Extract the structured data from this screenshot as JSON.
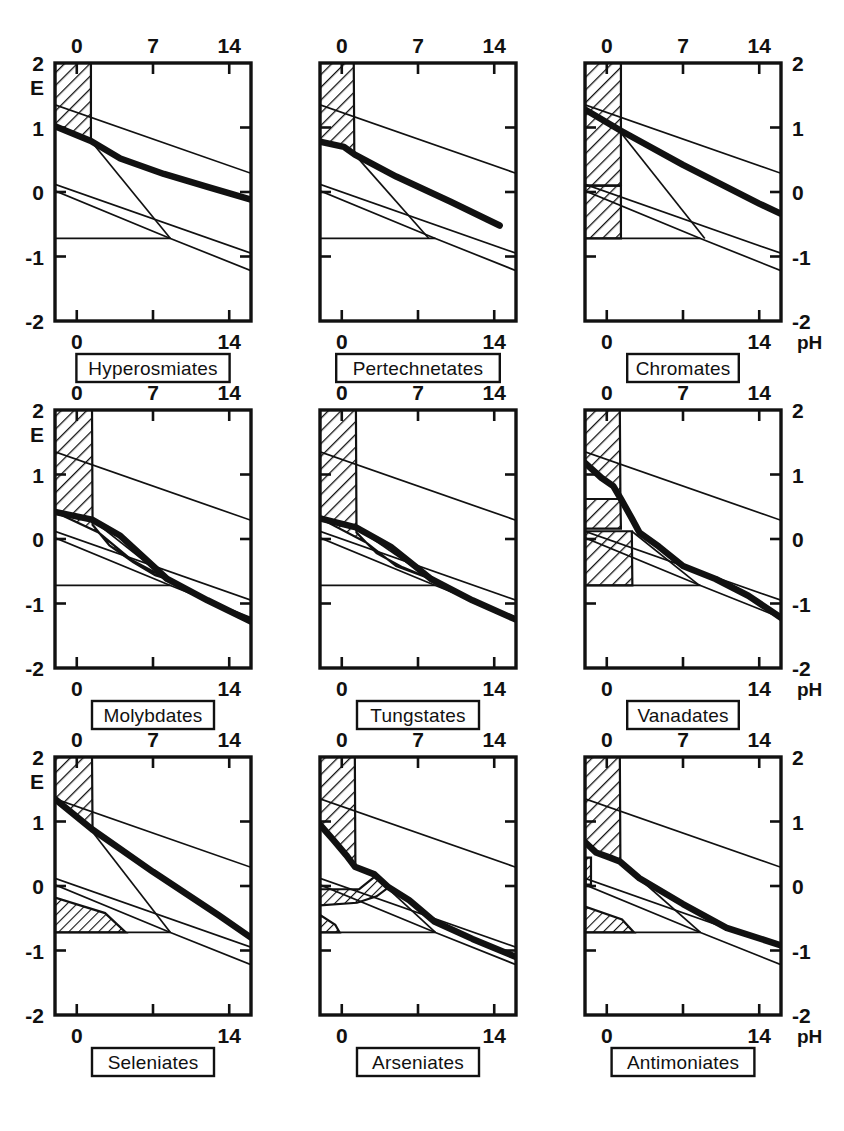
{
  "figure": {
    "type": "multi-panel-pourbaix",
    "rows": 3,
    "cols": 3,
    "axis_x_name": "pH",
    "axis_y_name": "E",
    "x_ticks": [
      "0",
      "7",
      "14"
    ],
    "x_tick_values": [
      0,
      7,
      14
    ],
    "y_ticks": [
      "2",
      "1",
      "0",
      "-1",
      "-2"
    ],
    "y_tick_values": [
      2,
      1,
      0,
      -1,
      -2
    ],
    "xlim": [
      -2,
      16
    ],
    "ylim": [
      -2,
      2
    ],
    "ink_color": "#111111",
    "paper_color": "#ffffff"
  },
  "chart_data": {
    "type": "line",
    "title": "",
    "subtitle": "",
    "xlabel": "pH",
    "ylabel": "E",
    "xlim": [
      -2,
      16
    ],
    "ylim": [
      -2,
      2
    ],
    "x_ticks": [
      0,
      7,
      14
    ],
    "y_ticks": [
      2,
      1,
      0,
      -1,
      -2
    ],
    "grid": false,
    "legend": "none",
    "panel_count": 9,
    "shared_series": [
      {
        "name": "oxygen-line",
        "note": "upper water stability limit, thin straight line",
        "points": [
          [
            -2,
            1.35
          ],
          [
            16,
            0.29
          ]
        ]
      },
      {
        "name": "hydrogen-line",
        "note": "lower water stability limit, thin straight line",
        "points": [
          [
            -2,
            0.12
          ],
          [
            16,
            -0.95
          ]
        ]
      },
      {
        "name": "neutral-baseline",
        "note": "thin horizontal line at E = -0.72 running from left axis to the crossing point",
        "points": [
          [
            -2,
            -0.72
          ],
          [
            8.6,
            -0.72
          ]
        ]
      },
      {
        "name": "lower-boundary-wedge",
        "note": "thin line descending from E = 0.02 at pH -2 to the junction near pH 8.6, then continuing to lower right",
        "points": [
          [
            -2,
            0.02
          ],
          [
            8.6,
            -0.72
          ],
          [
            16,
            -1.22
          ]
        ]
      }
    ],
    "panels": [
      {
        "index": 0,
        "row": 0,
        "col": 0,
        "label": "Hyperosmiates",
        "hatched_regions": [
          {
            "name": "acid-block",
            "note": "rectangle from pH -2 to 1.3, E 0.88 to 2.0"
          }
        ],
        "thick_curve": {
          "name": "stability-boundary",
          "points": [
            [
              -2,
              1.02
            ],
            [
              1.3,
              0.79
            ],
            [
              4.0,
              0.52
            ],
            [
              8.0,
              0.28
            ],
            [
              12.0,
              0.08
            ],
            [
              16.0,
              -0.12
            ]
          ]
        },
        "thin_wedge": {
          "points": [
            [
              1.3,
              0.79
            ],
            [
              8.6,
              -0.72
            ]
          ]
        }
      },
      {
        "index": 1,
        "row": 0,
        "col": 1,
        "label": "Pertechnetates",
        "hatched_regions": [
          {
            "name": "acid-block",
            "note": "rectangle from pH -2 to 1.1, E 0.62 to 2.0"
          }
        ],
        "thick_curve": {
          "name": "stability-boundary",
          "points": [
            [
              -2,
              0.78
            ],
            [
              0.2,
              0.7
            ],
            [
              1.2,
              0.58
            ],
            [
              5.0,
              0.24
            ],
            [
              10.0,
              -0.15
            ],
            [
              14.5,
              -0.52
            ]
          ]
        },
        "thin_wedge": {
          "points": [
            [
              1.2,
              0.58
            ],
            [
              8.0,
              -0.72
            ]
          ]
        }
      },
      {
        "index": 2,
        "row": 0,
        "col": 2,
        "label": "Chromates",
        "hatched_regions": [
          {
            "name": "acid-block-upper",
            "note": "rectangle pH -2 to 1.3, E 0.05 to 2.0"
          },
          {
            "name": "acid-block-lower",
            "note": "rectangle pH -2 to 1.3, E -0.72 to -0.28"
          }
        ],
        "thick_curve": {
          "name": "stability-boundary",
          "points": [
            [
              -2,
              1.28
            ],
            [
              1.3,
              0.95
            ],
            [
              7.0,
              0.42
            ],
            [
              14.0,
              -0.18
            ],
            [
              16.0,
              -0.34
            ]
          ]
        },
        "thin_wedge": {
          "points": [
            [
              1.3,
              0.92
            ],
            [
              9.0,
              -0.72
            ]
          ]
        }
      },
      {
        "index": 3,
        "row": 1,
        "col": 0,
        "label": "Molybdates",
        "hatched_regions": [
          {
            "name": "acid-block",
            "note": "rectangle pH -2 to 1.4, E 0.40 to 2.0"
          },
          {
            "name": "tapering-tail",
            "note": "narrow hatched wedge from pH 1.4 to 8.3 tapering to the junction"
          }
        ],
        "thick_curve": {
          "name": "stability-boundary",
          "points": [
            [
              -2,
              0.42
            ],
            [
              1.4,
              0.3
            ],
            [
              4.0,
              0.05
            ],
            [
              8.3,
              -0.62
            ],
            [
              12.0,
              -0.95
            ],
            [
              16.0,
              -1.28
            ]
          ]
        },
        "thin_wedge": {
          "points": [
            [
              1.4,
              0.3
            ],
            [
              8.3,
              -0.62
            ]
          ]
        }
      },
      {
        "index": 4,
        "row": 1,
        "col": 1,
        "label": "Tungstates",
        "hatched_regions": [
          {
            "name": "acid-block",
            "note": "rectangle pH -2 to 1.3, E 0.30 to 2.0"
          },
          {
            "name": "tapering-tail",
            "note": "narrow hatched wedge from pH 1.3 to 8.2"
          }
        ],
        "thick_curve": {
          "name": "stability-boundary",
          "points": [
            [
              -2,
              0.32
            ],
            [
              1.3,
              0.18
            ],
            [
              4.5,
              -0.12
            ],
            [
              8.2,
              -0.62
            ],
            [
              12.0,
              -0.95
            ],
            [
              16.0,
              -1.25
            ]
          ]
        },
        "thin_wedge": {
          "points": [
            [
              1.3,
              0.18
            ],
            [
              8.2,
              -0.62
            ]
          ]
        }
      },
      {
        "index": 5,
        "row": 1,
        "col": 2,
        "label": "Vanadates",
        "hatched_regions": [
          {
            "name": "acid-block-upper",
            "note": "rectangle pH -2 to 1.2, E 0.12 to 2.0"
          },
          {
            "name": "acid-block-lower",
            "note": "rectangle pH -2 to 2.3, E -0.72 to 0.12"
          }
        ],
        "thick_curve": {
          "name": "stability-boundary",
          "points": [
            [
              -2,
              1.18
            ],
            [
              -0.5,
              0.95
            ],
            [
              0.6,
              0.82
            ],
            [
              1.3,
              0.62
            ],
            [
              2.3,
              0.32
            ],
            [
              3.0,
              0.1
            ],
            [
              4.8,
              -0.12
            ],
            [
              7.0,
              -0.42
            ],
            [
              10.0,
              -0.62
            ],
            [
              13.0,
              -0.88
            ],
            [
              16.0,
              -1.22
            ]
          ]
        },
        "thin_wedge": {
          "points": [
            [
              2.3,
              0.12
            ],
            [
              8.5,
              -0.72
            ]
          ]
        }
      },
      {
        "index": 6,
        "row": 2,
        "col": 0,
        "label": "Seleniates",
        "hatched_regions": [
          {
            "name": "acid-block-upper",
            "note": "rectangle pH -2 to 1.4, E 0.62 to 2.0"
          },
          {
            "name": "lower-triangle",
            "note": "hatched triangle from pH -2 to 4.5 between E -0.72 and -0.18"
          }
        ],
        "thick_curve": {
          "name": "stability-boundary",
          "points": [
            [
              -2,
              1.35
            ],
            [
              1.4,
              0.88
            ],
            [
              7.0,
              0.22
            ],
            [
              13.0,
              -0.45
            ],
            [
              16.0,
              -0.8
            ]
          ]
        },
        "thin_wedge": {
          "points": [
            [
              1.4,
              0.85
            ],
            [
              8.6,
              -0.72
            ]
          ]
        }
      },
      {
        "index": 7,
        "row": 2,
        "col": 1,
        "label": "Arseniates",
        "hatched_regions": [
          {
            "name": "acid-block-upper",
            "note": "rectangle pH -2 to 1.2, E 0.32 to 2.0"
          },
          {
            "name": "step-band",
            "note": "hatched band from pH -2 to 4.3 between the thick curve and E -0.05"
          },
          {
            "name": "small-lower-wedge",
            "note": "tiny hatched wedge near pH -2 to -0.6 at E -0.72 to -0.45"
          }
        ],
        "thick_curve": {
          "name": "stability-boundary",
          "points": [
            [
              -2,
              0.95
            ],
            [
              -0.8,
              0.72
            ],
            [
              0.4,
              0.48
            ],
            [
              1.2,
              0.3
            ],
            [
              3.0,
              0.18
            ],
            [
              4.3,
              -0.02
            ],
            [
              6.2,
              -0.22
            ],
            [
              8.5,
              -0.55
            ],
            [
              12.0,
              -0.82
            ],
            [
              16.0,
              -1.1
            ]
          ]
        },
        "thin_wedge": {
          "points": [
            [
              4.3,
              -0.05
            ],
            [
              8.6,
              -0.72
            ]
          ]
        }
      },
      {
        "index": 8,
        "row": 2,
        "col": 2,
        "label": "Antimoniates",
        "hatched_regions": [
          {
            "name": "acid-block-upper",
            "note": "rectangle pH -2 to 1.2, E 0.42 to 2.0"
          },
          {
            "name": "narrow-spike",
            "note": "thin vertical hatched sliver at pH -2 to -1.4 down to E 0.05"
          },
          {
            "name": "lower-triangle",
            "note": "hatched triangle from pH -2 to 2.5 between E -0.72 and -0.32"
          }
        ],
        "thick_curve": {
          "name": "stability-boundary",
          "points": [
            [
              -2,
              0.68
            ],
            [
              -1.0,
              0.52
            ],
            [
              0.3,
              0.44
            ],
            [
              1.2,
              0.38
            ],
            [
              3.0,
              0.12
            ],
            [
              7.0,
              -0.28
            ],
            [
              11.0,
              -0.65
            ],
            [
              16.0,
              -0.92
            ]
          ]
        },
        "thin_wedge": {
          "points": [
            [
              1.2,
              0.38
            ],
            [
              8.6,
              -0.72
            ]
          ]
        }
      }
    ]
  }
}
